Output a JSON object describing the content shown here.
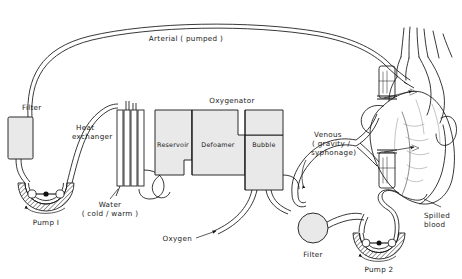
{
  "diagram": {
    "colors": {
      "line": "#151515",
      "box_fill": "#e9e9e9",
      "background": "#ffffff",
      "hatch": "#151515"
    },
    "labels": {
      "arterial": "Arterial ( pumped )",
      "filter_arterial": "Filter",
      "heat_exchanger_line1": "Heat",
      "heat_exchanger_line2": "exchanger",
      "pump1": "Pump I",
      "water_line1": "Water",
      "water_line2": "( cold / warm )",
      "oxygenator": "Oxygenator",
      "reservoir": "Reservoir",
      "defoamer": "Defoamer",
      "bubble": "Bubble",
      "oxygen": "Oxygen",
      "venous_line1": "Venous",
      "venous_line2": "( gravity /",
      "venous_line3": "syphonage)",
      "filter_suction": "Filter",
      "pump2": "Pump 2",
      "spilled_line1": "Spilled",
      "spilled_line2": "blood"
    },
    "components": [
      {
        "name": "arterial-filter",
        "label": "Filter",
        "shape": "rectangle"
      },
      {
        "name": "roller-pump-1",
        "label": "Pump I",
        "shape": "roller-pump"
      },
      {
        "name": "heat-exchanger",
        "label": "Heat exchanger",
        "shape": "tube-bundle"
      },
      {
        "name": "reservoir-chamber",
        "label": "Reservoir",
        "shape": "rectangle"
      },
      {
        "name": "defoamer-chamber",
        "label": "Defoamer",
        "shape": "rectangle"
      },
      {
        "name": "bubble-chamber",
        "label": "Bubble",
        "shape": "rectangle"
      },
      {
        "name": "suction-filter",
        "label": "Filter",
        "shape": "circle"
      },
      {
        "name": "roller-pump-2",
        "label": "Pump 2",
        "shape": "roller-pump"
      },
      {
        "name": "heart",
        "label": "Heart",
        "shape": "anatomical-heart"
      }
    ],
    "flows": [
      {
        "name": "arterial-pumped",
        "label": "Arterial ( pumped )",
        "direction": "pump-to-heart"
      },
      {
        "name": "venous-return",
        "label": "Venous ( gravity / syphonage)",
        "direction": "heart-to-oxygenator"
      },
      {
        "name": "oxygen-inlet",
        "label": "Oxygen",
        "direction": "into-bubble-chamber"
      },
      {
        "name": "spilled-blood-suction",
        "label": "Spilled blood",
        "direction": "field-to-pump2"
      },
      {
        "name": "water-circuit",
        "label": "Water ( cold / warm )",
        "direction": "through-heat-exchanger"
      }
    ]
  }
}
